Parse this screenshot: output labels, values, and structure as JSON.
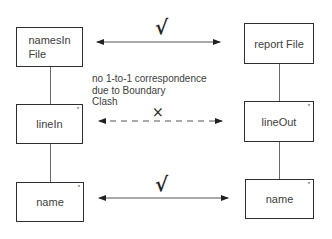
{
  "diagram": {
    "left_column": [
      {
        "id": "namesInFile",
        "label_lines": [
          "namesIn",
          "File"
        ],
        "iterated": false
      },
      {
        "id": "lineIn",
        "label_lines": [
          "lineIn"
        ],
        "iterated": true
      },
      {
        "id": "nameLeft",
        "label_lines": [
          "name"
        ],
        "iterated": true
      }
    ],
    "right_column": [
      {
        "id": "reportFile",
        "label_lines": [
          "report File"
        ],
        "iterated": false
      },
      {
        "id": "lineOut",
        "label_lines": [
          "lineOut"
        ],
        "iterated": true
      },
      {
        "id": "nameRight",
        "label_lines": [
          "name"
        ],
        "iterated": true
      }
    ],
    "iteration_marker": "*",
    "correspondences": [
      {
        "from": "namesInFile",
        "to": "reportFile",
        "style": "solid",
        "mark": "√",
        "mark_name": "check-mark"
      },
      {
        "from": "lineIn",
        "to": "lineOut",
        "style": "dashed",
        "mark": "×",
        "mark_name": "cross-mark"
      },
      {
        "from": "nameLeft",
        "to": "nameRight",
        "style": "solid",
        "mark": "√",
        "mark_name": "check-mark"
      }
    ],
    "note_lines": [
      "no 1-to-1 correspondence",
      "due to Boundary",
      "Clash"
    ]
  },
  "colors": {
    "line": "#2e2e2e",
    "connector": "#6a6a6a",
    "text": "#404040",
    "background": "#ffffff"
  }
}
